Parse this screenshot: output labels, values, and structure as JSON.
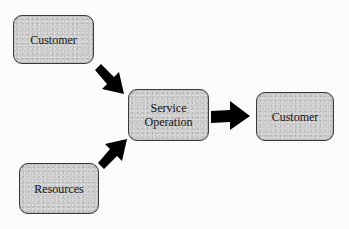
{
  "diagram": {
    "type": "flow",
    "nodes": [
      {
        "id": "customer-in",
        "label": "Customer"
      },
      {
        "id": "service",
        "label_lines": [
          "Service",
          "Operation"
        ]
      },
      {
        "id": "customer-out",
        "label": "Customer"
      },
      {
        "id": "resources",
        "label": "Resources"
      }
    ],
    "edges": [
      {
        "from": "customer-in",
        "to": "service"
      },
      {
        "from": "resources",
        "to": "service"
      },
      {
        "from": "service",
        "to": "customer-out"
      }
    ],
    "colors": {
      "node_fill": "#c9c9c9",
      "node_border": "#3a3a3a",
      "arrow": "#000000",
      "text": "#111111"
    }
  }
}
